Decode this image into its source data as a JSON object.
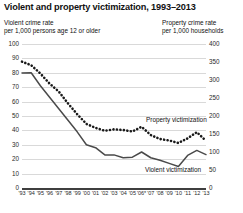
{
  "chart_data": {
    "type": "line",
    "title": "Violent and property victimization, 1993–2013",
    "left_axis_caption_line1": "Violent crime rate",
    "left_axis_caption_line2": "per 1,000 persons age 12 or older",
    "right_axis_caption_line1": "Property crime rate",
    "right_axis_caption_line2": "per 1,000 households",
    "xlabel": "",
    "ylabel": "Violent crime rate per 1,000 persons age 12 or older",
    "y2label": "Property crime rate per 1,000 households",
    "grid": true,
    "legend_position": "inline-annotation",
    "ylim": [
      0,
      100
    ],
    "y2lim": [
      0,
      400
    ],
    "yticks": [
      0,
      10,
      20,
      30,
      40,
      50,
      60,
      70,
      80,
      90,
      100
    ],
    "y2ticks": [
      0,
      50,
      100,
      150,
      200,
      250,
      300,
      350,
      400
    ],
    "categories": [
      "'93",
      "'94",
      "'95",
      "'96",
      "'97",
      "'98",
      "'99",
      "'00",
      "'01",
      "'02",
      "'03",
      "'04",
      "'05",
      "'06*",
      "'07",
      "'08",
      "'09",
      "'10",
      "'11",
      "'12",
      "'13"
    ],
    "series": [
      {
        "name": "Property victimization",
        "axis": "right",
        "style": "dotted",
        "color": "#1a1a1a",
        "values": [
          351,
          341,
          318,
          290,
          268,
          235,
          205,
          178,
          167,
          159,
          163,
          161,
          157,
          170,
          147,
          136,
          132,
          125,
          138,
          155,
          131
        ]
      },
      {
        "name": "Violent victimization",
        "axis": "left",
        "style": "solid",
        "color": "#4a4a4a",
        "values": [
          79.8,
          80.0,
          71.0,
          63.0,
          55.0,
          47.0,
          39.0,
          30.0,
          28.0,
          23.0,
          23.0,
          21.0,
          21.4,
          25.0,
          21.0,
          19.3,
          17.1,
          14.9,
          22.6,
          26.1,
          23.2
        ]
      }
    ],
    "annotations": [
      {
        "text": "Property victimization",
        "series": "Property victimization"
      },
      {
        "text": "Violent victimization",
        "series": "Violent victimization"
      }
    ]
  },
  "colors": {
    "background": "#ffffff",
    "gridline": "#d9d9d9",
    "axis": "#3f3f3f",
    "property_series": "#1a1a1a",
    "violent_series": "#4a4a4a",
    "text": "#111111"
  }
}
